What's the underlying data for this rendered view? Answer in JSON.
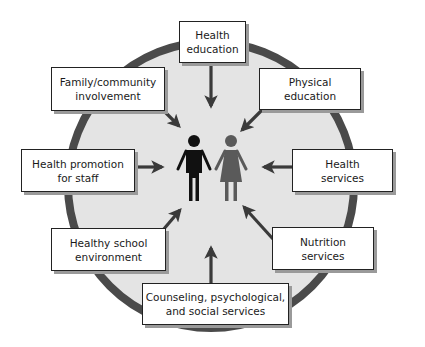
{
  "diagram": {
    "type": "component-wheel",
    "colors": {
      "ring": "#4a4a4a",
      "fill": "#e4e4e4",
      "arrow": "#3a3a3a",
      "male_figure": "#111111",
      "female_figure": "#5a5a5a",
      "box_border": "#222222",
      "box_shadow": "#9a9a9a"
    },
    "center": {
      "figures": [
        "male-figure",
        "female-figure"
      ]
    },
    "components": [
      {
        "id": "health-education",
        "label": "Health\neducation"
      },
      {
        "id": "physical-education",
        "label": "Physical\neducation"
      },
      {
        "id": "health-services",
        "label": "Health\nservices"
      },
      {
        "id": "nutrition-services",
        "label": "Nutrition\nservices"
      },
      {
        "id": "counseling-services",
        "label": "Counseling, psychological,\nand social services"
      },
      {
        "id": "healthy-school-environment",
        "label": "Healthy school\nenvironment"
      },
      {
        "id": "health-promotion-staff",
        "label": "Health promotion\nfor staff"
      },
      {
        "id": "family-community-involvement",
        "label": "Family/community\ninvolvement"
      }
    ]
  }
}
